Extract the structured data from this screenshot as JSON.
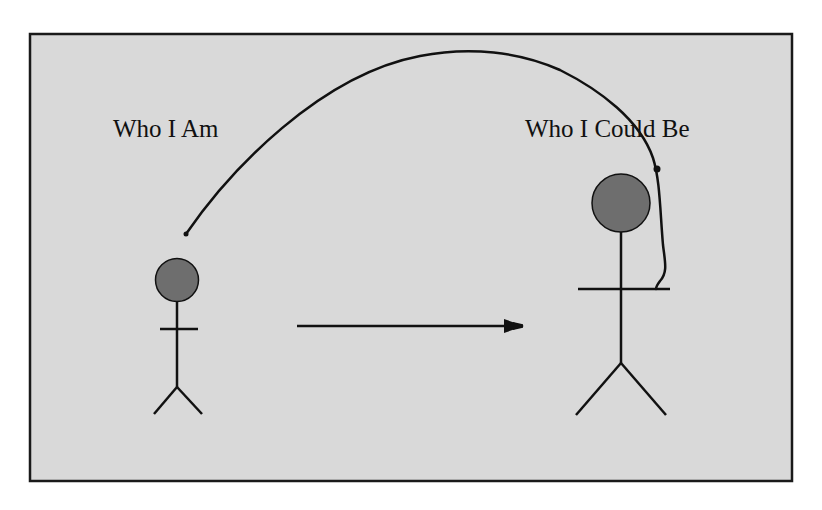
{
  "diagram": {
    "background_color": "#d9d9d9",
    "border_color": "#1a1a1a",
    "stroke_color": "#111111",
    "head_fill_color": "#6e6e6e",
    "labels": {
      "left": "Who I Am",
      "right": "Who I Could Be"
    },
    "figures": [
      {
        "name": "current-self",
        "label": "Who I Am"
      },
      {
        "name": "potential-self",
        "label": "Who I Could Be"
      }
    ],
    "connectors": [
      {
        "type": "straight-arrow",
        "from": "current-self",
        "to": "potential-self"
      },
      {
        "type": "curved-line",
        "from": "current-self",
        "to": "potential-self"
      }
    ]
  }
}
